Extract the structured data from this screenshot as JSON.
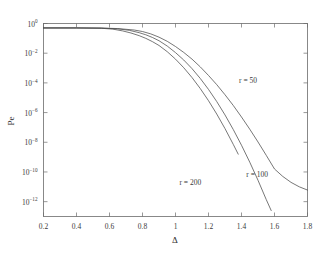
{
  "chart_data": {
    "type": "line",
    "title": "",
    "xlabel": "Δ",
    "ylabel": "Pe",
    "xlim": [
      0.2,
      1.8
    ],
    "ylim_exponent": [
      -13,
      0
    ],
    "yscale": "log",
    "grid": false,
    "legend_position": "inline-annotations",
    "xticks": [
      "0.2",
      "0.4",
      "0.6",
      "0.8",
      "1",
      "1.2",
      "1.4",
      "1.6",
      "1.8"
    ],
    "xtick_values": [
      0.2,
      0.4,
      0.6,
      0.8,
      1.0,
      1.2,
      1.4,
      1.6,
      1.8
    ],
    "ytick_labels": [
      "10⁰",
      "10⁻²",
      "10⁻⁴",
      "10⁻⁶",
      "10⁻⁸",
      "10⁻¹⁰",
      "10⁻¹²"
    ],
    "ytick_exponents": [
      0,
      -2,
      -4,
      -6,
      -8,
      -10,
      -12
    ],
    "ytick_mantissa": "10",
    "series": [
      {
        "name": "r = 50",
        "label": "r = 50",
        "label_x": 1.44,
        "label_y_exponent": -4.0,
        "x": [
          0.2,
          0.4,
          0.55,
          0.65,
          0.75,
          0.8,
          0.85,
          0.9,
          0.95,
          1.0,
          1.05,
          1.1,
          1.15,
          1.2,
          1.25,
          1.3,
          1.35,
          1.4,
          1.45,
          1.5,
          1.55,
          1.6,
          1.65,
          1.7,
          1.75,
          1.8
        ],
        "y_exponents": [
          -0.3,
          -0.3,
          -0.31,
          -0.34,
          -0.44,
          -0.54,
          -0.7,
          -0.92,
          -1.2,
          -1.55,
          -1.95,
          -2.4,
          -2.92,
          -3.5,
          -4.12,
          -4.8,
          -5.52,
          -6.3,
          -7.12,
          -7.98,
          -8.88,
          -9.8,
          -10.3,
          -10.7,
          -11.0,
          -11.22
        ]
      },
      {
        "name": "r = 100",
        "label": "r = 100",
        "label_x": 1.495,
        "label_y_exponent": -10.35,
        "x": [
          0.2,
          0.4,
          0.55,
          0.65,
          0.72,
          0.78,
          0.82,
          0.86,
          0.9,
          0.95,
          1.0,
          1.05,
          1.1,
          1.15,
          1.2,
          1.25,
          1.3,
          1.35,
          1.4,
          1.45,
          1.5,
          1.55,
          1.58
        ],
        "y_exponents": [
          -0.3,
          -0.3,
          -0.31,
          -0.36,
          -0.46,
          -0.62,
          -0.76,
          -0.94,
          -1.16,
          -1.52,
          -1.96,
          -2.46,
          -3.04,
          -3.7,
          -4.44,
          -5.26,
          -6.16,
          -7.14,
          -8.2,
          -9.34,
          -10.56,
          -11.86,
          -12.6
        ]
      },
      {
        "name": "r = 200",
        "label": "r = 200",
        "label_x": 1.09,
        "label_y_exponent": -10.85,
        "x": [
          0.2,
          0.4,
          0.55,
          0.62,
          0.68,
          0.73,
          0.78,
          0.82,
          0.86,
          0.9,
          0.95,
          1.0,
          1.05,
          1.1,
          1.15,
          1.2,
          1.25,
          1.3,
          1.35,
          1.38
        ],
        "y_exponents": [
          -0.3,
          -0.3,
          -0.32,
          -0.38,
          -0.5,
          -0.64,
          -0.82,
          -1.0,
          -1.22,
          -1.48,
          -1.9,
          -2.4,
          -2.98,
          -3.64,
          -4.38,
          -5.2,
          -6.1,
          -7.08,
          -8.14,
          -8.8
        ]
      }
    ]
  },
  "axis": {
    "x_title": "Δ",
    "y_title": "Pe"
  },
  "colors": {
    "background": "#ffffff",
    "frame": "#6b6b6b",
    "curve": "#4a4a4a",
    "text": "#3a3a3a"
  }
}
